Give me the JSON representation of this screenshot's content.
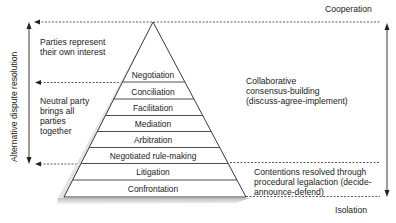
{
  "diagram": {
    "top_label": "Cooperation",
    "bottom_label": "Isolation",
    "left_axis_label": "Alternative dispute resolution",
    "left_notes": {
      "upper": [
        "Parties represent",
        "their own interest"
      ],
      "lower": [
        "Neutral party",
        "brings all",
        "parties",
        "together"
      ]
    },
    "right_notes": {
      "upper": [
        "Collaborative",
        "consensus-building",
        "(discuss-agree-implement)"
      ],
      "lower": [
        "Contentions resolved through",
        "procedural legalaction (decide-",
        "announce-defend)"
      ]
    },
    "pyramid_levels": [
      "Negotiation",
      "Conciliation",
      "Facilitation",
      "Mediation",
      "Arbitration",
      "Negotiated rule-making",
      "Litigation",
      "Confrontation"
    ],
    "colors": {
      "line": "#222222",
      "text": "#222222",
      "shadow": "#c8c8c8",
      "background": "#ffffff"
    }
  }
}
